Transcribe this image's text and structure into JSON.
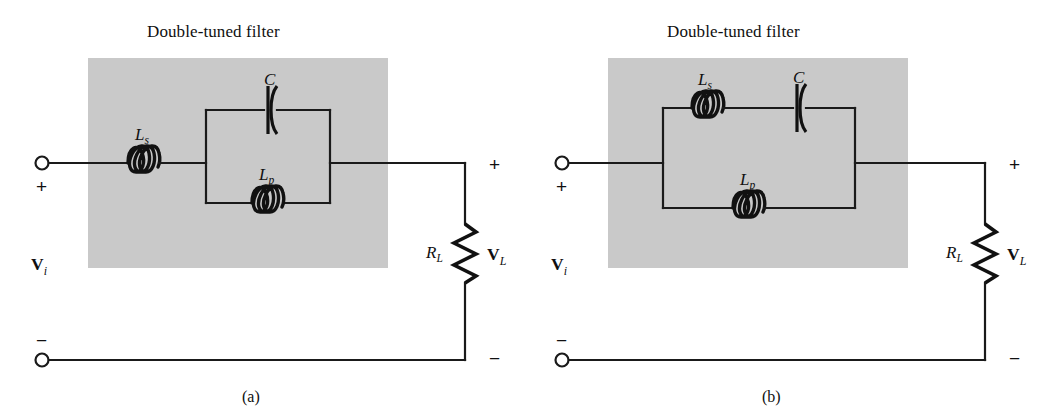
{
  "figure": {
    "type": "circuit-schematic-pair",
    "background": "#ffffff",
    "shade_color": "#c9c9c9",
    "line_color": "#1a1a1a"
  },
  "panel_a": {
    "caption": "(a)",
    "filter_title": "Double-tuned filter",
    "labels": {
      "series_inductor": "L",
      "series_inductor_sub": "s",
      "capacitor": "C",
      "parallel_inductor": "L",
      "parallel_inductor_sub": "p",
      "load_resistor": "R",
      "load_resistor_sub": "L",
      "input_voltage": "V",
      "input_voltage_sub": "i",
      "load_voltage": "V",
      "load_voltage_sub": "L",
      "input_plus": "+",
      "input_minus": "−",
      "output_plus": "+",
      "output_minus": "−"
    },
    "topology": "Ls in series; C parallel with Lp forming tank; RL load"
  },
  "panel_b": {
    "caption": "(b)",
    "filter_title": "Double-tuned filter",
    "labels": {
      "series_inductor": "L",
      "series_inductor_sub": "s",
      "capacitor": "C",
      "parallel_inductor": "L",
      "parallel_inductor_sub": "p",
      "load_resistor": "R",
      "load_resistor_sub": "L",
      "input_voltage": "V",
      "input_voltage_sub": "i",
      "load_voltage": "V",
      "load_voltage_sub": "L",
      "input_plus": "+",
      "input_minus": "−",
      "output_plus": "+",
      "output_minus": "−"
    },
    "topology": "Ls in series with C on top branch; Lp on bottom branch; RL load"
  }
}
